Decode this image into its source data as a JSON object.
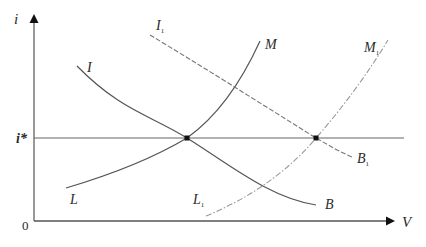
{
  "diagram": {
    "type": "economics-curve-diagram",
    "axes": {
      "y_label": "i",
      "x_label": "V",
      "origin_label": "0",
      "equilibrium_rate_label": "i*"
    },
    "curves": [
      {
        "id": "I-B",
        "start_label": "I",
        "end_label": "B",
        "style": "solid"
      },
      {
        "id": "L-M",
        "start_label": "L",
        "end_label": "M",
        "style": "solid"
      },
      {
        "id": "I1-B1",
        "start_label": "I",
        "start_sub": "1",
        "end_label": "B",
        "end_sub": "1",
        "style": "dashed"
      },
      {
        "id": "L1-M1",
        "start_label": "L",
        "start_sub": "1",
        "end_label": "M",
        "end_sub": "1",
        "style": "dash-dot"
      }
    ],
    "equilibrium_points": [
      {
        "name": "original-equilibrium",
        "x_px": 187,
        "y_px": 138
      },
      {
        "name": "shifted-equilibrium",
        "x_px": 316,
        "y_px": 138
      }
    ],
    "colors": {
      "line": "#555555",
      "dashed": "#777777",
      "dashdot": "#999999",
      "text": "#2a2a2a"
    }
  }
}
